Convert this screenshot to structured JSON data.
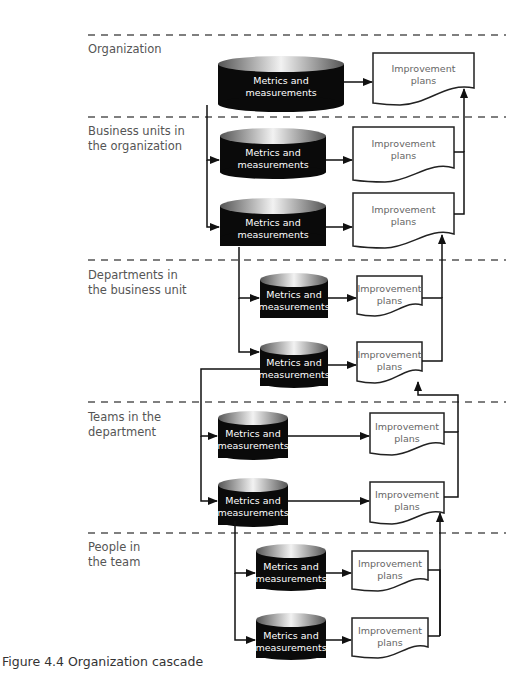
{
  "figure": {
    "caption": "Figure 4.4  Organization cascade",
    "box_label": "Metrics and\nmeasurements",
    "doc_label": "Improvement\nplans"
  },
  "tiers": [
    {
      "label": "Organization"
    },
    {
      "label": "Business units in\nthe organization"
    },
    {
      "label": "Departments in\nthe business unit"
    },
    {
      "label": "Teams in the\ndepartment"
    },
    {
      "label": "People in\nthe team"
    }
  ],
  "nodes": [
    {
      "tier": 0,
      "metrics": "Metrics and\nmeasurements",
      "plans": "Improvement\nplans"
    },
    {
      "tier": 1,
      "metrics": "Metrics and\nmeasurements",
      "plans": "Improvement\nplans"
    },
    {
      "tier": 1,
      "metrics": "Metrics and\nmeasurements",
      "plans": "Improvement\nplans"
    },
    {
      "tier": 2,
      "metrics": "Metrics and\nmeasurements",
      "plans": "Improvement\nplans"
    },
    {
      "tier": 2,
      "metrics": "Metrics and\nmeasurements",
      "plans": "Improvement\nplans"
    },
    {
      "tier": 3,
      "metrics": "Metrics and\nmeasurements",
      "plans": "Improvement\nplans"
    },
    {
      "tier": 3,
      "metrics": "Metrics and\nmeasurements",
      "plans": "Improvement\nplans"
    },
    {
      "tier": 4,
      "metrics": "Metrics and\nmeasurements",
      "plans": "Improvement\nplans"
    },
    {
      "tier": 4,
      "metrics": "Metrics and\nmeasurements",
      "plans": "Improvement\nplans"
    }
  ],
  "colors": {
    "cylinder_fill": "#0a0a0a",
    "line": "#222222",
    "dash": "#555555",
    "label_text": "#555555"
  }
}
